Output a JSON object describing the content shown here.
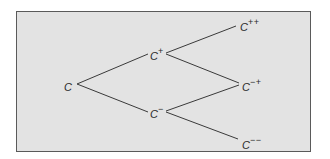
{
  "diagram": {
    "type": "binomial-tree",
    "colors": {
      "background": "#ffffff",
      "frame_fill": "#e3e3e3",
      "frame_border": "#5a5a5a",
      "line": "#3a3a3a",
      "text": "#2a2a2a"
    },
    "nodes": [
      {
        "id": "root",
        "base": "C",
        "sup": "",
        "x": 64,
        "y": 79
      },
      {
        "id": "up",
        "base": "C",
        "sup": "+",
        "x": 150,
        "y": 48
      },
      {
        "id": "down",
        "base": "C",
        "sup": "−",
        "x": 150,
        "y": 106
      },
      {
        "id": "upup",
        "base": "C",
        "sup": "++",
        "x": 240,
        "y": 19
      },
      {
        "id": "downup",
        "base": "C",
        "sup": "−+",
        "x": 242,
        "y": 79
      },
      {
        "id": "downdown",
        "base": "C",
        "sup": "−−",
        "x": 242,
        "y": 137
      }
    ],
    "edges": [
      {
        "from": "root",
        "to": "up"
      },
      {
        "from": "root",
        "to": "down"
      },
      {
        "from": "up",
        "to": "upup"
      },
      {
        "from": "up",
        "to": "downup"
      },
      {
        "from": "down",
        "to": "downup"
      },
      {
        "from": "down",
        "to": "downdown"
      }
    ]
  }
}
